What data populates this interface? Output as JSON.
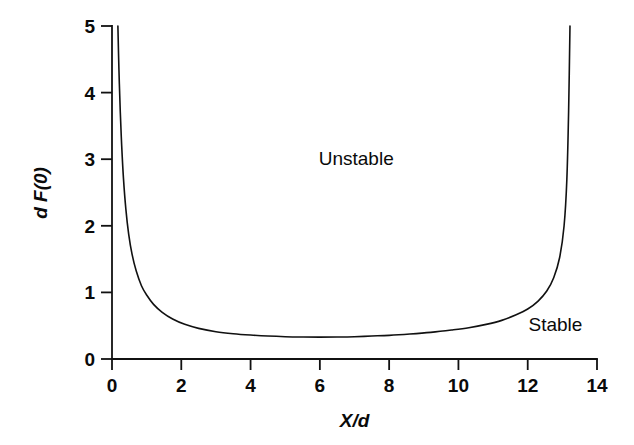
{
  "chart_data": {
    "type": "line",
    "title": "",
    "xlabel": "X/d",
    "ylabel": "d F(0)",
    "xlim": [
      0,
      14
    ],
    "ylim": [
      0,
      5
    ],
    "xticks": [
      "0",
      "2",
      "4",
      "6",
      "8",
      "10",
      "12",
      "14"
    ],
    "xtick_values": [
      0,
      2,
      4,
      6,
      8,
      10,
      12,
      14
    ],
    "yticks": [
      "0",
      "1",
      "2",
      "3",
      "4",
      "5"
    ],
    "ytick_values": [
      0,
      1,
      2,
      3,
      4,
      5
    ],
    "grid": false,
    "legend": "none",
    "line_color": "#111111",
    "line_width": 1.6,
    "series": [
      {
        "name": "stability boundary",
        "x": [
          0.17,
          0.2,
          0.24,
          0.28,
          0.33,
          0.4,
          0.48,
          0.58,
          0.7,
          0.85,
          1.0,
          1.2,
          1.45,
          1.75,
          2.1,
          2.5,
          3.0,
          3.5,
          4.0,
          4.5,
          5.0,
          5.5,
          6.0,
          6.5,
          7.0,
          7.5,
          8.0,
          8.6,
          9.2,
          9.8,
          10.3,
          10.8,
          11.25,
          11.65,
          12.0,
          12.3,
          12.55,
          12.75,
          12.92,
          13.05,
          13.13,
          13.18,
          13.22
        ],
        "y": [
          5.0,
          4.35,
          3.7,
          3.2,
          2.72,
          2.25,
          1.88,
          1.57,
          1.32,
          1.1,
          0.96,
          0.82,
          0.7,
          0.6,
          0.52,
          0.46,
          0.41,
          0.38,
          0.36,
          0.345,
          0.335,
          0.33,
          0.328,
          0.33,
          0.335,
          0.345,
          0.355,
          0.375,
          0.4,
          0.435,
          0.47,
          0.52,
          0.58,
          0.66,
          0.75,
          0.87,
          1.02,
          1.22,
          1.52,
          2.0,
          2.7,
          3.7,
          5.0
        ]
      }
    ],
    "annotations": [
      {
        "text": "Unstable",
        "x": 7.05,
        "y": 3.02
      },
      {
        "text": "Stable",
        "x": 12.8,
        "y": 0.52
      }
    ]
  },
  "axes": {
    "x_axis_name": "x-axis",
    "y_axis_name": "y-axis"
  }
}
